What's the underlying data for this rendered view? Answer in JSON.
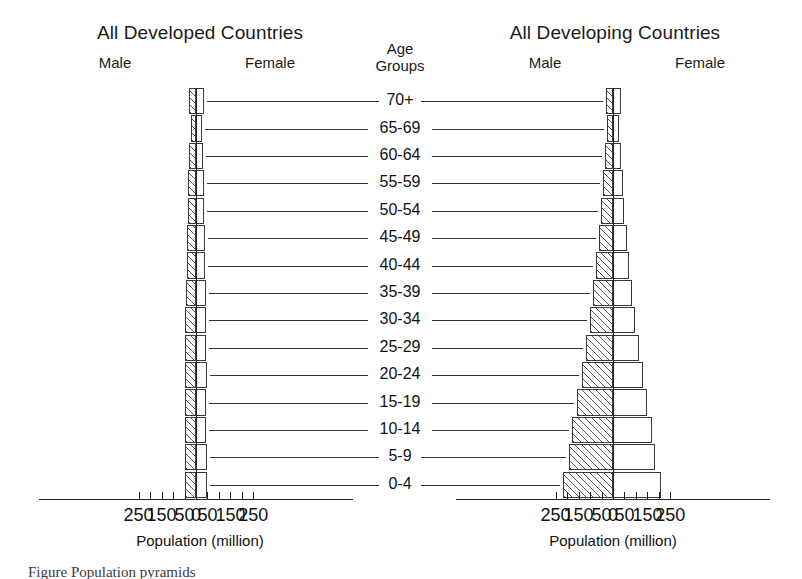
{
  "figure": {
    "caption": "Figure   Population pyramids"
  },
  "panels": [
    {
      "id": "developed",
      "title": "All Developed Countries",
      "male_label": "Male",
      "female_label": "Female",
      "axis_title": "Population (million)"
    },
    {
      "id": "developing",
      "title": "All Developing Countries",
      "male_label": "Male",
      "female_label": "Female",
      "axis_title": "Population (million)"
    }
  ],
  "age_header": {
    "line1": "Age",
    "line2": "Groups"
  },
  "axis": {
    "ticks": [
      250,
      150,
      50,
      0,
      50,
      150,
      250
    ],
    "tick_labels": [
      "250",
      "150",
      "50",
      "0",
      "50",
      "150",
      "250"
    ],
    "min": -250,
    "max": 250,
    "minor_step": 50,
    "unit": "million"
  },
  "chart_data": {
    "type": "bar",
    "subtype": "population-pyramid",
    "title": "Population pyramids",
    "xlabel": "Population (million)",
    "ylabel": "Age Groups",
    "xlim": [
      -250,
      250
    ],
    "grid": false,
    "legend_position": "none",
    "categories": [
      "0-4",
      "5-9",
      "10-14",
      "15-19",
      "20-24",
      "25-29",
      "30-34",
      "35-39",
      "40-44",
      "45-49",
      "50-54",
      "55-59",
      "60-64",
      "65-69",
      "70+"
    ],
    "panels": [
      {
        "name": "All Developed Countries",
        "series": [
          {
            "name": "Male",
            "values": [
              49,
              48,
              47,
              47,
              48,
              47,
              46,
              44,
              40,
              39,
              35,
              34,
              31,
              23,
              30
            ]
          },
          {
            "name": "Female",
            "values": [
              47,
              46,
              45,
              45,
              46,
              45,
              45,
              43,
              39,
              38,
              35,
              34,
              32,
              24,
              37
            ]
          }
        ]
      },
      {
        "name": "All Developing Countries",
        "series": [
          {
            "name": "Male",
            "values": [
              219,
              191,
              178,
              158,
              136,
              117,
              100,
              86,
              73,
              62,
              52,
              43,
              35,
              26,
              32
            ]
          },
          {
            "name": "Female",
            "values": [
              210,
              182,
              168,
              150,
              130,
              112,
              96,
              83,
              70,
              59,
              50,
              42,
              34,
              25,
              33
            ]
          }
        ]
      }
    ]
  }
}
